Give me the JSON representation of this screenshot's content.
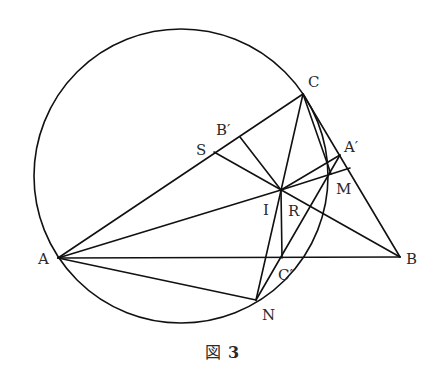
{
  "figure": {
    "caption_prefix": "図",
    "caption_number": "3",
    "stroke_color": "#111111",
    "background": "#ffffff"
  },
  "circle": {
    "cx": 181,
    "cy": 176,
    "r": 147
  },
  "points": {
    "A": {
      "label": "A",
      "x": 58,
      "y": 258
    },
    "B": {
      "label": "B",
      "x": 400,
      "y": 257
    },
    "C": {
      "label": "C",
      "x": 303,
      "y": 94
    },
    "I": {
      "label": "I",
      "x": 281,
      "y": 190
    },
    "S": {
      "label": "S",
      "x": 214,
      "y": 152
    },
    "Bp": {
      "label": "B′",
      "x": 240,
      "y": 137
    },
    "Ap": {
      "label": "A′",
      "x": 340,
      "y": 155
    },
    "M": {
      "label": "M",
      "x": 331,
      "y": 174
    },
    "Af": {
      "label": "",
      "x": 350,
      "y": 168
    },
    "Cp": {
      "label": "C′",
      "x": 282,
      "y": 258
    },
    "N": {
      "label": "N",
      "x": 256,
      "y": 300
    },
    "R": {
      "label": "R",
      "x": 292,
      "y": 208
    }
  },
  "segments": [
    [
      "A",
      "B"
    ],
    [
      "A",
      "C"
    ],
    [
      "C",
      "B"
    ],
    [
      "A",
      "I"
    ],
    [
      "C",
      "N"
    ],
    [
      "A",
      "N"
    ],
    [
      "S",
      "B"
    ],
    [
      "Bp",
      "I"
    ],
    [
      "I",
      "Ap"
    ],
    [
      "I",
      "Af"
    ],
    [
      "I",
      "Cp"
    ],
    [
      "N",
      "Ap"
    ],
    [
      "C",
      "M"
    ]
  ],
  "labels": [
    {
      "text": "A",
      "x": 38,
      "y": 264
    },
    {
      "text": "B",
      "x": 406,
      "y": 264
    },
    {
      "text": "C",
      "x": 308,
      "y": 87
    },
    {
      "text": "S",
      "x": 196,
      "y": 155
    },
    {
      "text": "B′",
      "x": 216,
      "y": 135
    },
    {
      "text": "A′",
      "x": 344,
      "y": 152
    },
    {
      "text": "M",
      "x": 336,
      "y": 194
    },
    {
      "text": "I",
      "x": 263,
      "y": 215
    },
    {
      "text": "R",
      "x": 288,
      "y": 216
    },
    {
      "text": "C′",
      "x": 278,
      "y": 280
    },
    {
      "text": "N",
      "x": 262,
      "y": 320
    }
  ]
}
